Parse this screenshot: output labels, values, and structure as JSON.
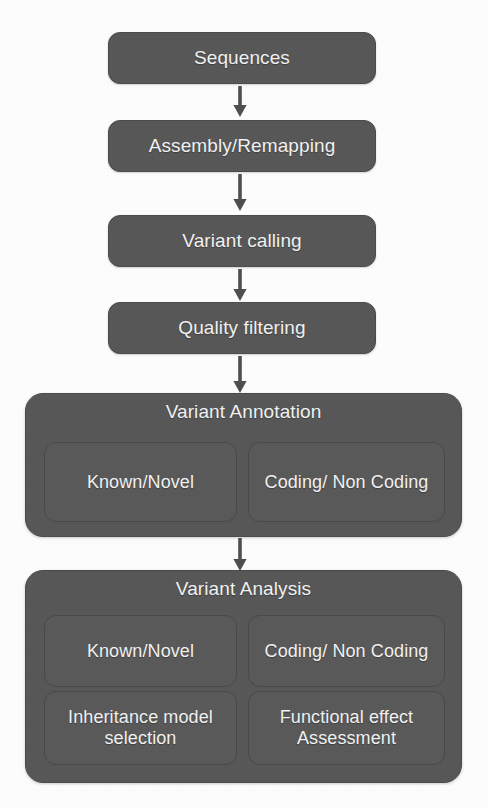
{
  "figure": {
    "type": "flowchart",
    "orientation": "top-to-bottom",
    "background_color": "#fdfdfd",
    "node_color": "#585858",
    "node_text_color": "#f2f2f2",
    "arrow_color": "#4f4f4f"
  },
  "steps": [
    {
      "id": "sequences",
      "label": "Sequences"
    },
    {
      "id": "assembly-remapping",
      "label": "Assembly/Remapping"
    },
    {
      "id": "variant-calling",
      "label": "Variant calling"
    },
    {
      "id": "quality-filtering",
      "label": "Quality filtering"
    }
  ],
  "groups": [
    {
      "id": "variant-annotation",
      "title": "Variant Annotation",
      "children": [
        {
          "id": "annotation-known-novel",
          "label": "Known/Novel"
        },
        {
          "id": "annotation-coding-noncoding",
          "label": "Coding/ Non Coding"
        }
      ]
    },
    {
      "id": "variant-analysis",
      "title": "Variant Analysis",
      "children": [
        {
          "id": "analysis-known-novel",
          "label": "Known/Novel"
        },
        {
          "id": "analysis-coding-noncoding",
          "label": "Coding/ Non Coding"
        },
        {
          "id": "analysis-inheritance-model",
          "label": "Inheritance model selection"
        },
        {
          "id": "analysis-functional-effect",
          "label": "Functional effect Assessment"
        }
      ]
    }
  ],
  "connectors": [
    {
      "id": "arrow-1",
      "from": "sequences",
      "to": "assembly-remapping"
    },
    {
      "id": "arrow-2",
      "from": "assembly-remapping",
      "to": "variant-calling"
    },
    {
      "id": "arrow-3",
      "from": "variant-calling",
      "to": "quality-filtering"
    },
    {
      "id": "arrow-4",
      "from": "quality-filtering",
      "to": "variant-annotation"
    },
    {
      "id": "arrow-5",
      "from": "variant-annotation",
      "to": "variant-analysis"
    }
  ]
}
